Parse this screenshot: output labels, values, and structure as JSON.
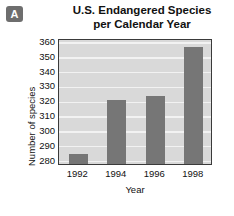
{
  "badge": {
    "label": "A"
  },
  "chart_data": {
    "type": "bar",
    "title": "U.S. Endangered Species per Calendar Year",
    "title_line1": "U.S. Endangered Species",
    "title_line2": "per Calendar Year",
    "xlabel": "Year",
    "ylabel": "Number of species",
    "categories": [
      "1992",
      "1994",
      "1996",
      "1998"
    ],
    "values": [
      284,
      320.5,
      323,
      356
    ],
    "yticks": [
      280,
      290,
      300,
      310,
      320,
      330,
      340,
      350,
      360
    ],
    "ylim": [
      277,
      362
    ],
    "grid": true,
    "legend": "none",
    "bar_color": "#767676",
    "plot_bg": "#d9d9d9",
    "gridline_color": "#f2f2f2",
    "axis_color": "#3a3a3a"
  }
}
